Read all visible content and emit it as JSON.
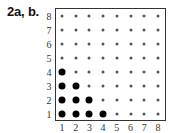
{
  "label": "2a, b.",
  "grid": {
    "x_ticks": [
      "1",
      "2",
      "3",
      "4",
      "5",
      "6",
      "7",
      "8"
    ],
    "y_ticks": [
      "1",
      "2",
      "3",
      "4",
      "5",
      "6",
      "7",
      "8"
    ],
    "highlighted_points": [
      [
        1,
        1
      ],
      [
        2,
        1
      ],
      [
        3,
        1
      ],
      [
        4,
        1
      ],
      [
        1,
        2
      ],
      [
        2,
        2
      ],
      [
        3,
        2
      ],
      [
        1,
        3
      ],
      [
        2,
        3
      ],
      [
        1,
        4
      ]
    ]
  }
}
